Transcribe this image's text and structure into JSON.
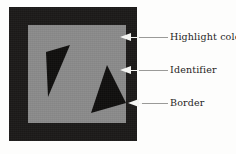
{
  "figure": {
    "name": "annotated-shape-diagram",
    "colors": {
      "border": "#1c1a19",
      "highlight": "#8b8b8b",
      "identifier": "#100f0e",
      "arrow": "#f4f4f2",
      "leader": "#9a9a98",
      "text": "#1f1d1c",
      "page_background": "#fdfdfc"
    },
    "regions": {
      "border_label": "Border",
      "highlight_label": "Highlight color",
      "identifier_label": "Identifier"
    },
    "identifiers": [
      {
        "name": "identifier-triangle-left",
        "points": "18,27 42,20 20,72"
      },
      {
        "name": "identifier-triangle-right",
        "points": "79,40 98,78 63,88"
      }
    ]
  },
  "callouts": [
    {
      "id": "callout-highlight",
      "label": "Highlight color",
      "arrow_icon": "left-arrow-icon",
      "target": "highlight-region"
    },
    {
      "id": "callout-identifier",
      "label": "Identifier",
      "arrow_icon": "left-arrow-icon",
      "target": "identifier-triangle-right"
    },
    {
      "id": "callout-border",
      "label": "Border",
      "arrow_icon": "left-arrow-icon",
      "target": "border-region"
    }
  ]
}
